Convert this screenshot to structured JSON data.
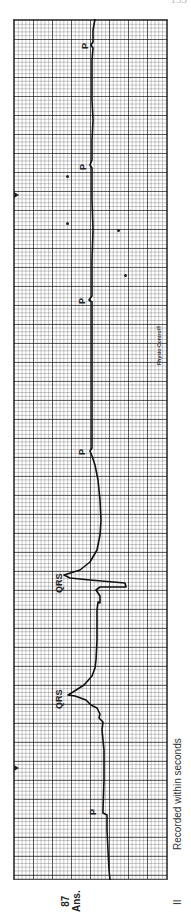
{
  "page": {
    "number": "133"
  },
  "strip": {
    "lead": "II",
    "caption": "Recorded within seconds",
    "brand": "Physio-Control®",
    "age_value": "87",
    "age_unit": "Ans."
  },
  "annotations": {
    "p_labels": [
      "P",
      "P",
      "P",
      "P",
      "P"
    ],
    "qrs_labels": [
      "QRS",
      "QRS"
    ]
  },
  "colors": {
    "grid_major": "#555555",
    "grid_minor": "#bbbbbb",
    "trace": "#111111"
  }
}
